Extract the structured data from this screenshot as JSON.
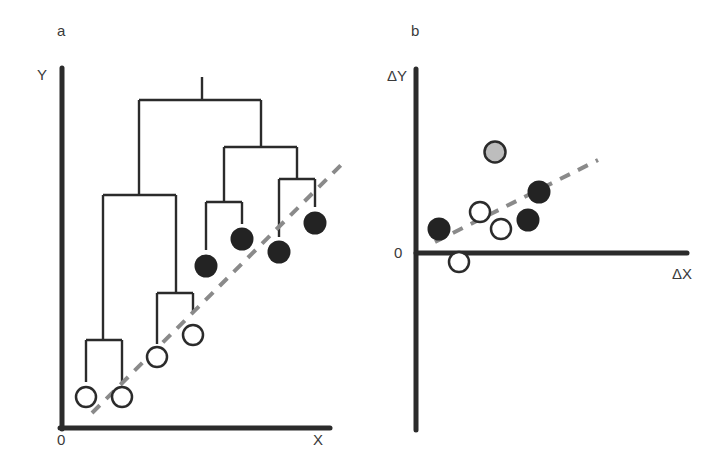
{
  "figure": {
    "panel_a": {
      "label": "a",
      "y_axis_label": "Y",
      "x_axis_label": "X",
      "origin_label": "0",
      "open_circles": [
        [
          86,
          397
        ],
        [
          122,
          397
        ],
        [
          157,
          357
        ],
        [
          193,
          335
        ]
      ],
      "filled_circles": [
        [
          206,
          265
        ],
        [
          242,
          239
        ],
        [
          279,
          252
        ],
        [
          315,
          223
        ]
      ],
      "trend_line": {
        "x1": 92,
        "y1": 413,
        "x2": 343,
        "y2": 163
      }
    },
    "panel_b": {
      "label": "b",
      "y_axis_label": "ΔY",
      "x_axis_label": "ΔX",
      "origin_label": "0",
      "open_circles": [
        [
          480,
          212
        ],
        [
          501,
          229
        ],
        [
          459,
          262
        ]
      ],
      "filled_circles": [
        [
          439,
          229
        ],
        [
          539,
          192
        ],
        [
          528,
          220
        ]
      ],
      "gray_circles": [
        [
          495,
          152
        ]
      ],
      "trend_line": {
        "x1": 435,
        "y1": 242,
        "x2": 598,
        "y2": 160
      }
    },
    "colors": {
      "axis": "#2b2b2b",
      "tree": "#2b2b2b",
      "filled": "#232323",
      "open_stroke": "#2b2b2b",
      "gray_fill": "#bdbdbd",
      "dash": "#8a8a8a",
      "text": "#3a3a3a"
    }
  }
}
